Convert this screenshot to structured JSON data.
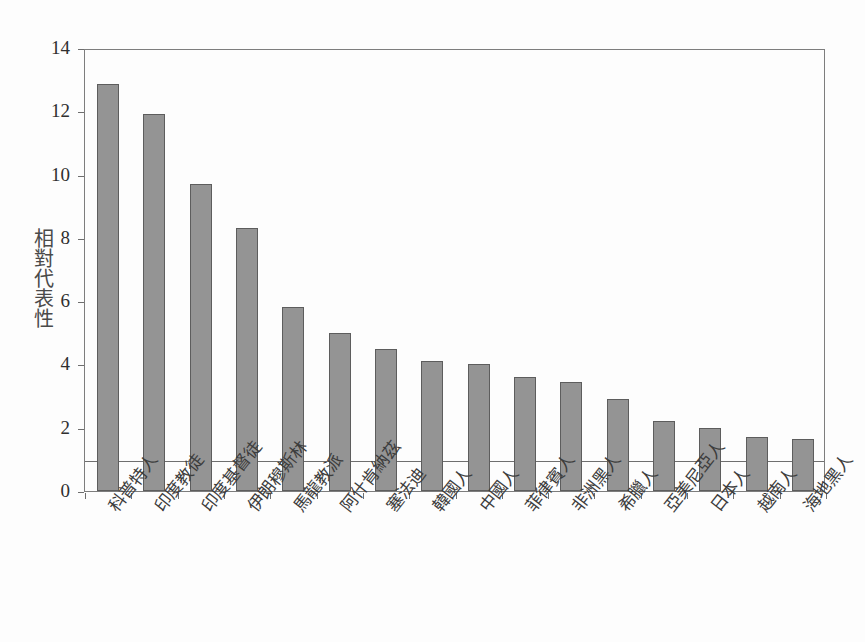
{
  "chart_data": {
    "type": "bar",
    "title": "",
    "subtitle": "",
    "xlabel": "",
    "ylabel": "相對代表性",
    "ylim": [
      0,
      14
    ],
    "yticks": [
      0,
      2,
      4,
      6,
      8,
      10,
      12,
      14
    ],
    "ytick_labels": [
      "0",
      "2",
      "4",
      "6",
      "8",
      "10",
      "12",
      "14"
    ],
    "grid": false,
    "legend": null,
    "reference_line": {
      "value": 1,
      "label": "1",
      "orientation": "horizontal"
    },
    "bar_color": "#949494",
    "bar_edge_color": "#5d5d5d",
    "axis_color": "#7d7d7d",
    "categories": [
      "科普特人",
      "印度教徒",
      "印度基督徒",
      "伊朗穆斯林",
      "馬龍教派",
      "阿什肯納茲",
      "塞法迪",
      "韓國人",
      "中國人",
      "菲律賓人",
      "非洲黑人",
      "希臘人",
      "亞美尼亞人",
      "日本人",
      "越南人",
      "海地黑人"
    ],
    "values": [
      12.85,
      11.9,
      9.7,
      8.3,
      5.8,
      5.0,
      4.5,
      4.1,
      4.0,
      3.6,
      3.45,
      2.9,
      2.2,
      2.0,
      1.7,
      1.65
    ]
  }
}
